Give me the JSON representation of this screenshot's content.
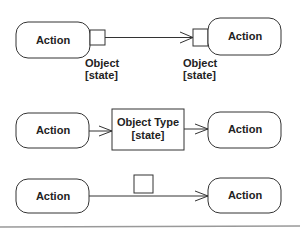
{
  "diagram": {
    "type": "UML activity diagram - object flow notations",
    "row1": {
      "left_action": "Action",
      "right_action": "Action",
      "left_pin_label_line1": "Object",
      "left_pin_label_line2": "[state]",
      "right_pin_label_line1": "Object",
      "right_pin_label_line2": "[state]"
    },
    "row2": {
      "left_action": "Action",
      "object_node_line1": "Object Type",
      "object_node_line2": "[state]",
      "right_action": "Action"
    },
    "row3": {
      "left_action": "Action",
      "right_action": "Action"
    },
    "colors": {
      "stroke": "#333333",
      "text": "#222222",
      "background": "#ffffff",
      "rule": "#999999"
    }
  }
}
